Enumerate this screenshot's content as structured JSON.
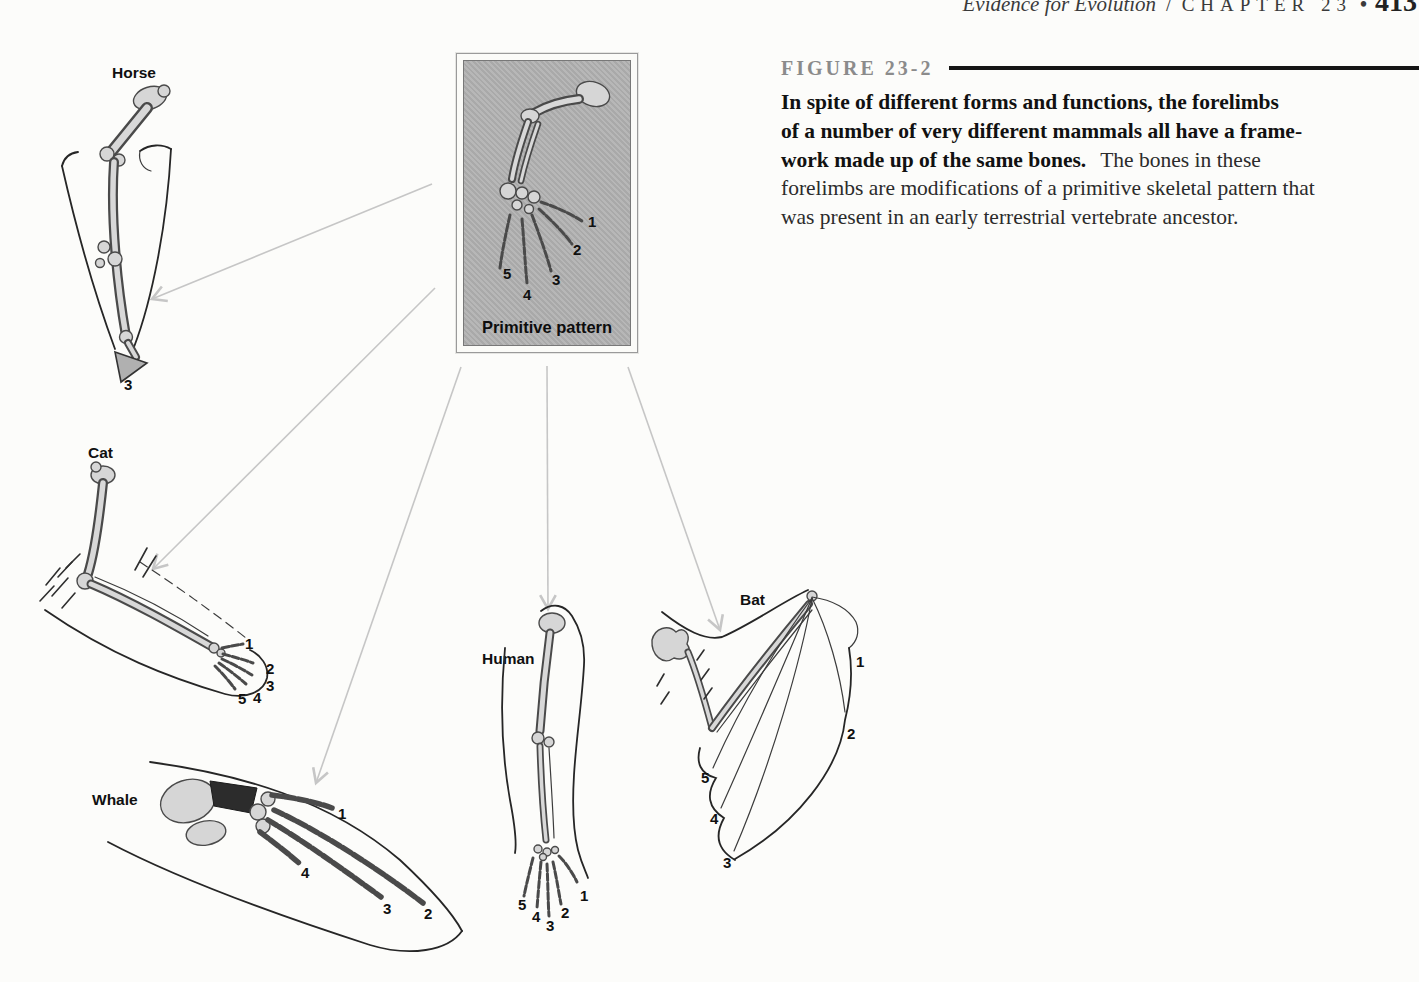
{
  "header": {
    "running_title": "Evidence for Evolution",
    "divider": "/",
    "chapter": "CHAPTER 23",
    "bullet": "•",
    "page_number": "413"
  },
  "figure": {
    "label": "FIGURE 23-2",
    "caption_bold_line1": "In spite of different forms and functions, the forelimbs",
    "caption_bold_line2": "of a number of very different mammals all have a frame-",
    "caption_bold_line3": "work made up of the same bones.",
    "caption_reg_line3": "The bones in these",
    "caption_reg_line4": "forelimbs are modifications of a primitive skeletal pattern that",
    "caption_reg_line5": "was present in an early terrestrial vertebrate ancestor."
  },
  "diagram": {
    "primitive_box": {
      "label": "Primitive pattern",
      "digits": [
        "1",
        "2",
        "3",
        "4",
        "5"
      ]
    },
    "limbs": {
      "horse": {
        "label": "Horse",
        "digits": [
          "3"
        ]
      },
      "cat": {
        "label": "Cat",
        "digits": [
          "1",
          "2",
          "3",
          "5",
          "4"
        ]
      },
      "whale": {
        "label": "Whale",
        "digits": [
          "1",
          "4",
          "3",
          "2"
        ]
      },
      "human": {
        "label": "Human",
        "digits": [
          "5",
          "4",
          "3",
          "2",
          "1"
        ]
      },
      "bat": {
        "label": "Bat",
        "digits": [
          "1",
          "2",
          "5",
          "4",
          "3"
        ]
      }
    },
    "colors": {
      "arrow": "#c6c6c6",
      "box_fill": "#b2b2b2",
      "figure_label": "#8b8b8b",
      "ink": "#1c1c1c"
    }
  }
}
